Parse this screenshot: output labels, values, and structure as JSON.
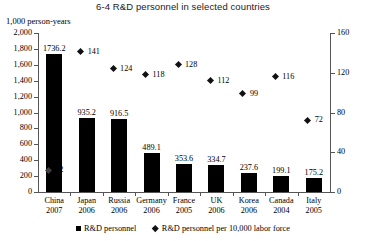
{
  "chart_data": {
    "type": "bar",
    "title": "6-4 R&D personnel in selected countries",
    "xlabel": "",
    "ylabel": "1,000 person-years",
    "y2label": "",
    "ylim": [
      0,
      2000
    ],
    "y2lim": [
      0,
      160
    ],
    "grid": false,
    "legend_position": "bottom",
    "categories": [
      "China",
      "Japan",
      "Russia",
      "Germany",
      "France",
      "UK",
      "Korea",
      "Canada",
      "Italy"
    ],
    "years": [
      "2007",
      "2006",
      "2006",
      "2006",
      "2005",
      "2006",
      "2006",
      "2004",
      "2005"
    ],
    "series": [
      {
        "name": "R&D personnel",
        "axis": "left",
        "type": "bar",
        "values": [
          1736.2,
          935.2,
          916.5,
          489.1,
          353.6,
          334.7,
          237.6,
          199.1,
          175.2
        ]
      },
      {
        "name": "R&D personnel per 10,000 labor force",
        "axis": "right",
        "type": "scatter",
        "values": [
          22,
          141,
          124,
          118,
          128,
          112,
          99,
          116,
          72
        ]
      }
    ],
    "yticks_left": [
      "0",
      "200",
      "400",
      "600",
      "800",
      "1,000",
      "1,200",
      "1,400",
      "1,600",
      "1,800",
      "2,000"
    ],
    "yticks_right": [
      "0",
      "40",
      "80",
      "120",
      "160"
    ],
    "legend": [
      {
        "label": "R&D personnel",
        "marker": "square"
      },
      {
        "label": "R&D personnel per 10,000 labor force",
        "marker": "diamond"
      }
    ]
  }
}
